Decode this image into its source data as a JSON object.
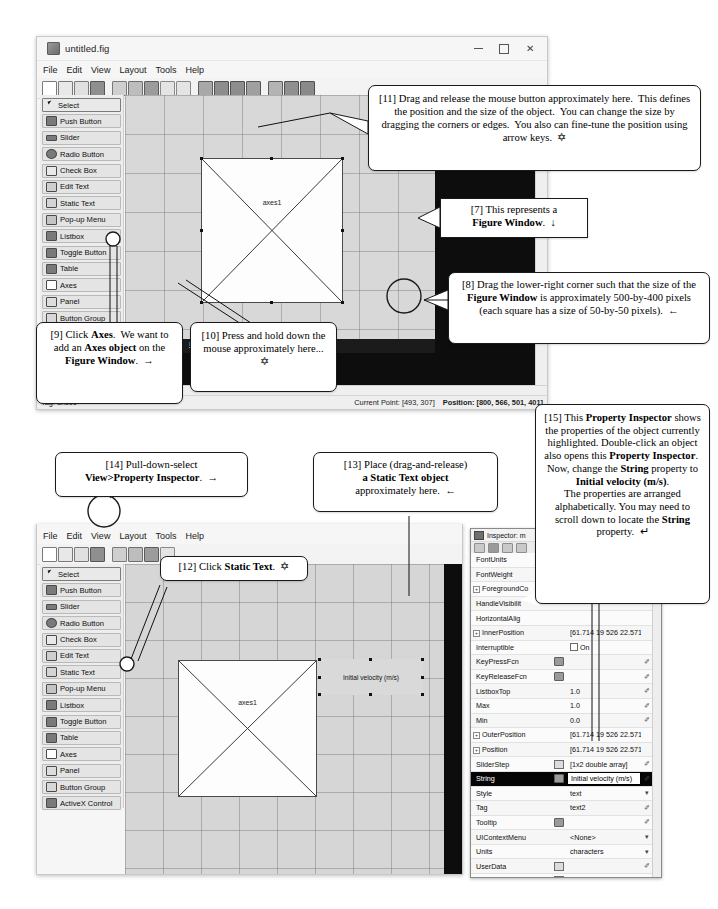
{
  "window1": {
    "title": "untitled.fig",
    "menus": [
      "File",
      "Edit",
      "View",
      "Layout",
      "Tools",
      "Help"
    ],
    "window_buttons": [
      "minimize",
      "maximize",
      "close"
    ],
    "palette": [
      {
        "label": "Select",
        "icon": "arrow-cursor-icon",
        "selected": true
      },
      {
        "label": "Push Button",
        "icon": "push-button-icon"
      },
      {
        "label": "Slider",
        "icon": "slider-icon"
      },
      {
        "label": "Radio Button",
        "icon": "radio-button-icon"
      },
      {
        "label": "Check Box",
        "icon": "check-box-icon"
      },
      {
        "label": "Edit Text",
        "icon": "edit-text-icon"
      },
      {
        "label": "Static Text",
        "icon": "static-text-icon"
      },
      {
        "label": "Pop-up Menu",
        "icon": "popup-menu-icon"
      },
      {
        "label": "Listbox",
        "icon": "listbox-icon"
      },
      {
        "label": "Toggle Button",
        "icon": "toggle-button-icon"
      },
      {
        "label": "Table",
        "icon": "table-icon"
      },
      {
        "label": "Axes",
        "icon": "axes-icon"
      },
      {
        "label": "Panel",
        "icon": "panel-icon"
      },
      {
        "label": "Button Group",
        "icon": "button-group-icon"
      },
      {
        "label": "ActiveX Control",
        "icon": "activex-icon"
      }
    ],
    "axes_object_label": "axes1",
    "status": {
      "tag": "Tag: axes1",
      "current_point": "Current Point: [493, 307]",
      "position": "Position: [800, 566, 501, 401]"
    },
    "banner_link": "Learn More"
  },
  "window2": {
    "menus": [
      "File",
      "Edit",
      "View",
      "Layout",
      "Tools",
      "Help"
    ],
    "highlighted_menu": "View",
    "palette": [
      {
        "label": "Select",
        "icon": "arrow-cursor-icon",
        "selected": true
      },
      {
        "label": "Push Button",
        "icon": "push-button-icon"
      },
      {
        "label": "Slider",
        "icon": "slider-icon"
      },
      {
        "label": "Radio Button",
        "icon": "radio-button-icon"
      },
      {
        "label": "Check Box",
        "icon": "check-box-icon"
      },
      {
        "label": "Edit Text",
        "icon": "edit-text-icon"
      },
      {
        "label": "Static Text",
        "icon": "static-text-icon"
      },
      {
        "label": "Pop-up Menu",
        "icon": "popup-menu-icon"
      },
      {
        "label": "Listbox",
        "icon": "listbox-icon"
      },
      {
        "label": "Toggle Button",
        "icon": "toggle-button-icon"
      },
      {
        "label": "Table",
        "icon": "table-icon"
      },
      {
        "label": "Axes",
        "icon": "axes-icon"
      },
      {
        "label": "Panel",
        "icon": "panel-icon"
      },
      {
        "label": "Button Group",
        "icon": "button-group-icon"
      },
      {
        "label": "ActiveX Control",
        "icon": "activex-icon"
      }
    ],
    "axes_object_label": "axes1",
    "static_text_label": "Initial velocity (m/s)"
  },
  "inspector": {
    "title": "Inspector:  m",
    "rows": [
      {
        "name": "FontUnits",
        "value": "",
        "mid": "",
        "end": "v",
        "expand": false
      },
      {
        "name": "FontWeight",
        "value": "",
        "mid": "",
        "end": "v",
        "expand": false
      },
      {
        "name": "ForegroundCo",
        "value": "",
        "mid": "",
        "end": "",
        "expand": true
      },
      {
        "name": "HandleVisibilit",
        "value": "",
        "mid": "",
        "end": "",
        "expand": false
      },
      {
        "name": "HorizontalAlig",
        "value": "",
        "mid": "",
        "end": "",
        "expand": false
      },
      {
        "name": "InnerPosition",
        "value": "[61.714 19 526 22.571...",
        "mid": "",
        "end": "",
        "expand": true
      },
      {
        "name": "Interruptible",
        "value": "On",
        "mid": "",
        "end": "",
        "expand": false,
        "checkbox": true
      },
      {
        "name": "KeyPressFcn",
        "value": "",
        "mid": "btn",
        "end": "pencil",
        "expand": false
      },
      {
        "name": "KeyReleaseFcn",
        "value": "",
        "mid": "btn",
        "end": "pencil",
        "expand": false
      },
      {
        "name": "ListboxTop",
        "value": "1.0",
        "mid": "",
        "end": "pencil",
        "expand": false
      },
      {
        "name": "Max",
        "value": "1.0",
        "mid": "",
        "end": "pencil",
        "expand": false
      },
      {
        "name": "Min",
        "value": "0.0",
        "mid": "",
        "end": "pencil",
        "expand": false
      },
      {
        "name": "OuterPosition",
        "value": "[61.714 19 526 22.571...",
        "mid": "",
        "end": "",
        "expand": true
      },
      {
        "name": "Position",
        "value": "[61.714 19 526 22.571...",
        "mid": "",
        "end": "",
        "expand": true
      },
      {
        "name": "SliderStep",
        "value": "[1x2  double array]",
        "mid": "grid",
        "end": "pencil",
        "expand": false
      },
      {
        "name": "String",
        "value": "Initial velocity (m/s)",
        "mid": "btn",
        "end": "pencil",
        "expand": false,
        "highlight": true
      },
      {
        "name": "Style",
        "value": "text",
        "mid": "",
        "end": "v",
        "expand": false
      },
      {
        "name": "Tag",
        "value": "text2",
        "mid": "",
        "end": "pencil",
        "expand": false
      },
      {
        "name": "Tooltip",
        "value": "",
        "mid": "btn",
        "end": "pencil",
        "expand": false
      },
      {
        "name": "UIContextMenu",
        "value": "<None>",
        "mid": "",
        "end": "v",
        "expand": false
      },
      {
        "name": "Units",
        "value": "characters",
        "mid": "",
        "end": "v",
        "expand": false
      },
      {
        "name": "UserData",
        "value": "",
        "mid": "grid",
        "end": "pencil",
        "expand": false
      },
      {
        "name": "Value",
        "value": "0.0",
        "mid": "grid",
        "end": "pencil",
        "expand": false
      },
      {
        "name": "Visible",
        "value": "On",
        "mid": "",
        "end": "",
        "expand": false,
        "checkbox": true
      }
    ]
  },
  "callouts": {
    "c11": {
      "id": "[11]",
      "html": "[11] Drag and release the mouse button approximately here.&nbsp; This defines the position and the size of the object.&nbsp; You can change the size by dragging the corners or edges.&nbsp; You also can fine-tune the position using arrow keys. &nbsp;&#10017;",
      "text": "[11] Drag and release the mouse button approximately here. This defines the position and the size of the object. You can change the size by dragging the corners or edges. You also can fine-tune the position using arrow keys."
    },
    "c7": {
      "id": "[7]",
      "html": "[7] This represents a<br><b>Figure Window</b>. &nbsp;&darr;",
      "text": "[7] This represents a Figure Window."
    },
    "c8": {
      "id": "[8]",
      "html": "[8] Drag the lower-right corner such that the size of the <b>Figure Window</b> is approximately 500-by-400 pixels (each square has a size of 50-by-50 pixels). &nbsp;&larr;",
      "text": "[8] Drag the lower-right corner such that the size of the Figure Window is approximately 500-by-400 pixels (each square has a size of 50-by-50 pixels)."
    },
    "c9": {
      "id": "[9]",
      "html": "[9] Click <b>Axes</b>.&nbsp; We want to add an <b>Axes object</b> on the <b>Figure Window</b>. &nbsp;&rarr;",
      "text": "[9] Click Axes. We want to add an Axes object on the Figure Window."
    },
    "c10": {
      "id": "[10]",
      "html": "[10] Press and hold down the mouse approximately here... &nbsp;&#10017;",
      "text": "[10] Press and hold down the mouse approximately here..."
    },
    "c12": {
      "id": "[12]",
      "html": "[12] Click <b>Static Text</b>. &nbsp;&#10017;",
      "text": "[12] Click Static Text."
    },
    "c13": {
      "id": "[13]",
      "html": "[13] Place (drag-and-release)<br><b>a Static Text object</b><br>approximately here. &nbsp;&larr;",
      "text": "[13] Place (drag-and-release) a Static Text object approximately here."
    },
    "c14": {
      "id": "[14]",
      "html": "[14] Pull-down-select<br><b>View&gt;Property Inspector</b>. &nbsp;&rarr;",
      "text": "[14] Pull-down-select View>Property Inspector."
    },
    "c15": {
      "id": "[15]",
      "html": "[15] This <b>Property Inspector</b> shows the properties of the object currently highlighted. Double-click an object also opens this <b>Property Inspector</b>.&nbsp; Now, change the <b>String</b> property to <b>Initial velocity (m/s)</b>.<br>The properties are arranged alphabetically. You may need to scroll down to locate the <b>String</b> property. &nbsp;&#8629;",
      "text": "[15] This Property Inspector shows the properties of the object currently highlighted. Double-click an object also opens this Property Inspector. Now, change the String property to Initial velocity (m/s). The properties are arranged alphabetically. You may need to scroll down to locate the String property."
    }
  },
  "colors": {
    "window_bg": "#f6f6f6",
    "canvas_bg": "#d8d8d8",
    "black_band": "#0d0d0d",
    "palette_bg": "#ededed",
    "highlight_row": "#050505"
  }
}
